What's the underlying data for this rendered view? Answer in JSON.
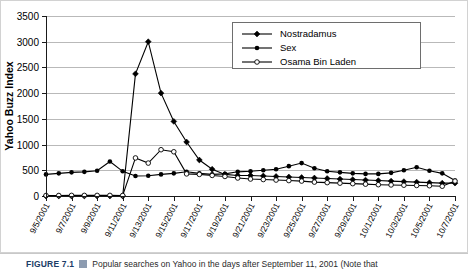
{
  "chart_data": {
    "type": "line",
    "title": "",
    "xlabel": "",
    "ylabel": "Yahoo Buzz Index",
    "ylim": [
      0,
      3500
    ],
    "ytick_step": 500,
    "yticks": [
      0,
      500,
      1000,
      1500,
      2000,
      2500,
      3000,
      3500
    ],
    "grid": true,
    "legend_position": "top-right",
    "x": [
      "9/5/2001",
      "9/6/2001",
      "9/7/2001",
      "9/8/2001",
      "9/9/2001",
      "9/10/2001",
      "9/11/2001",
      "9/12/2001",
      "9/13/2001",
      "9/14/2001",
      "9/15/2001",
      "9/16/2001",
      "9/17/2001",
      "9/18/2001",
      "9/19/2001",
      "9/20/2001",
      "9/21/2001",
      "9/22/2001",
      "9/23/2001",
      "9/24/2001",
      "9/25/2001",
      "9/26/2001",
      "9/27/2001",
      "9/28/2001",
      "9/29/2001",
      "9/30/2001",
      "10/1/2001",
      "10/2/2001",
      "10/3/2001",
      "10/4/2001",
      "10/5/2001",
      "10/6/2001",
      "10/7/2001"
    ],
    "xtick_labels": [
      "9/5/2001",
      "9/7/2001",
      "9/9/2001",
      "9/11/2001",
      "9/13/2001",
      "9/15/2001",
      "9/17/2001",
      "9/19/2001",
      "9/21/2001",
      "9/23/2001",
      "9/25/2001",
      "9/27/2001",
      "9/29/2001",
      "10/1/2001",
      "10/3/2001",
      "10/5/2001",
      "10/7/2001"
    ],
    "series": [
      {
        "name": "Nostradamus",
        "marker": "filled-diamond",
        "values": [
          0,
          0,
          0,
          0,
          0,
          0,
          0,
          2375,
          3000,
          2000,
          1450,
          1050,
          700,
          520,
          420,
          400,
          400,
          390,
          380,
          370,
          360,
          350,
          340,
          330,
          320,
          310,
          300,
          290,
          280,
          270,
          260,
          250,
          250
        ]
      },
      {
        "name": "Sex",
        "marker": "filled-circle",
        "values": [
          420,
          440,
          460,
          470,
          490,
          670,
          480,
          390,
          395,
          420,
          440,
          470,
          440,
          420,
          430,
          470,
          480,
          500,
          520,
          580,
          640,
          540,
          480,
          460,
          440,
          430,
          430,
          450,
          500,
          560,
          490,
          440,
          300
        ]
      },
      {
        "name": "Osama Bin Laden",
        "marker": "open-circle",
        "values": [
          10,
          10,
          12,
          12,
          12,
          12,
          10,
          740,
          640,
          900,
          860,
          430,
          420,
          400,
          380,
          350,
          330,
          320,
          310,
          300,
          290,
          270,
          260,
          250,
          240,
          230,
          220,
          215,
          210,
          205,
          200,
          190,
          290
        ]
      }
    ]
  },
  "caption": {
    "figure_number": "FIGURE 7.1",
    "glyph": "figure-marker-icon",
    "text": "Popular searches on Yahoo in the days after September 11, 2001 (Note that"
  }
}
